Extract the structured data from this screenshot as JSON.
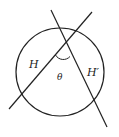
{
  "diagram": {
    "type": "geometry",
    "shapes": {
      "circle": {
        "cx": 60,
        "cy": 72,
        "r": 44
      },
      "line_H": {
        "x1": 9,
        "y1": 109,
        "x2": 92,
        "y2": 12
      },
      "line_H_prime": {
        "x1": 51,
        "y1": 10,
        "x2": 107,
        "y2": 127
      }
    },
    "labels": {
      "H": "H",
      "H_prime": "H′",
      "theta": "θ"
    },
    "stroke_color": "#222222",
    "background": "#ffffff"
  }
}
